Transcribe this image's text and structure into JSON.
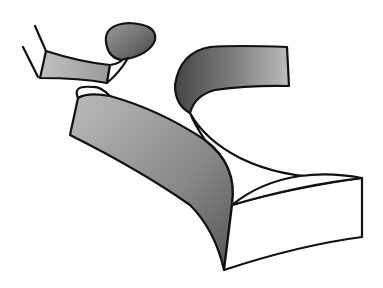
{
  "image": {
    "description": "Black-and-white line illustration of a 3D extruded letterform ribbon (stylized lowercase letters with a dot), halftone-shaded sides",
    "width": 383,
    "height": 288,
    "colors": {
      "background": "#ffffff",
      "outline": "#111111",
      "shade_light": "#c8c8c8",
      "shade_mid": "#9a9a9a",
      "shade_dark": "#555555"
    }
  }
}
